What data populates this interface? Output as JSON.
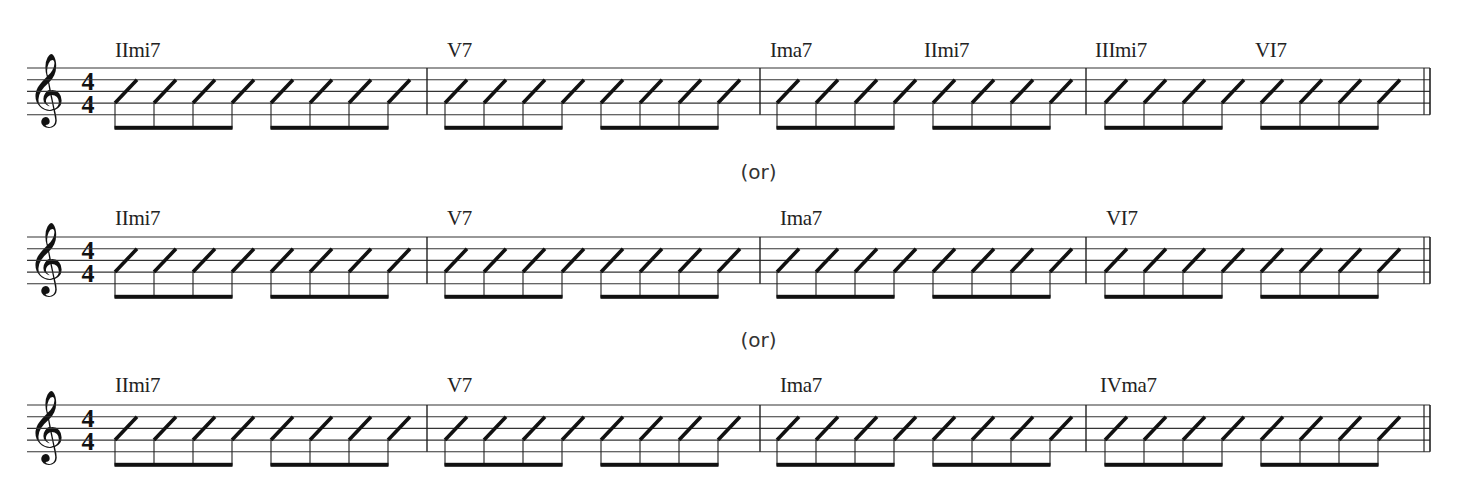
{
  "separator_label": "(or)",
  "time_signature": {
    "top": "4",
    "bottom": "4"
  },
  "clef": "treble",
  "clef_glyph": "𝄞",
  "ink_color": "#1a1a1a",
  "staves": [
    {
      "chords": [
        {
          "label": "IImi7",
          "x": 115
        },
        {
          "label": "V7",
          "x": 447
        },
        {
          "label": "Ima7",
          "x": 770
        },
        {
          "label": "IImi7",
          "x": 924
        },
        {
          "label": "IIImi7",
          "x": 1095
        },
        {
          "label": "VI7",
          "x": 1255
        }
      ]
    },
    {
      "chords": [
        {
          "label": "IImi7",
          "x": 115
        },
        {
          "label": "V7",
          "x": 447
        },
        {
          "label": "Ima7",
          "x": 780
        },
        {
          "label": "VI7",
          "x": 1106
        }
      ]
    },
    {
      "chords": [
        {
          "label": "IImi7",
          "x": 115
        },
        {
          "label": "V7",
          "x": 447
        },
        {
          "label": "Ima7",
          "x": 780
        },
        {
          "label": "IVma7",
          "x": 1100
        }
      ]
    }
  ],
  "measure": {
    "beats": 8,
    "rhythm": "eighth-note slashes, beamed in groups of four"
  }
}
